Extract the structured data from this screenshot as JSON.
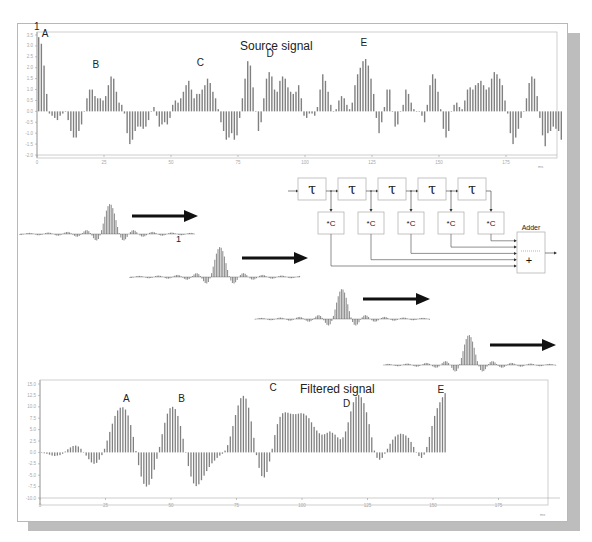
{
  "figure": {
    "title_source": "Source signal",
    "title_filtered": "Filtered signal",
    "marker_one_top": "1",
    "marker_one_mid": "1",
    "x_unit": "ms",
    "peak_labels_source": [
      "A",
      "B",
      "C",
      "D",
      "E"
    ],
    "peak_labels_filtered": [
      "A",
      "B",
      "C",
      "D",
      "E"
    ]
  },
  "diagram": {
    "delay_symbol": "τ",
    "delay_count": 5,
    "multiplier_label": "*C",
    "multiplier_count": 5,
    "adder_label": "Adder",
    "adder_symbol": "+"
  },
  "colors": {
    "bar": "#808080",
    "bar_dark": "#5a5a5a",
    "axis": "#9a9a9a",
    "tick_text": "#a8a8a8",
    "frame": "#b8b8b8",
    "shadow": "#bdbdbd",
    "arrow": "#111111",
    "text": "#222222"
  },
  "chart_data": [
    {
      "type": "bar",
      "title": "Source signal",
      "xlabel": "ms",
      "ylabel": "",
      "x_ticks": [
        0,
        25,
        50,
        75,
        100,
        125,
        150,
        175
      ],
      "y_ticks": [
        3.5,
        3.0,
        2.5,
        2.0,
        1.5,
        1.0,
        0.5,
        0.0,
        -0.5,
        -1.0,
        -1.5,
        -2.0
      ],
      "ylim": [
        -2.0,
        3.5
      ],
      "xlim": [
        0,
        194
      ],
      "grid": false,
      "annotations": [
        {
          "text": "A",
          "x": 3,
          "y": 3.4
        },
        {
          "text": "B",
          "x": 22,
          "y": 2.0
        },
        {
          "text": "C",
          "x": 61,
          "y": 2.1
        },
        {
          "text": "D",
          "x": 87,
          "y": 2.5
        },
        {
          "text": "E",
          "x": 122,
          "y": 3.0
        }
      ],
      "values": [
        3.4,
        3.1,
        2.1,
        0.8,
        -0.1,
        -0.2,
        -0.3,
        -0.4,
        -0.2,
        -0.1,
        0.0,
        -0.4,
        -0.9,
        -1.2,
        -1.2,
        -0.9,
        -0.6,
        0.0,
        0.6,
        1.0,
        1.0,
        0.7,
        0.6,
        0.6,
        0.5,
        0.7,
        1.2,
        1.6,
        1.5,
        0.9,
        0.4,
        0.3,
        -0.1,
        -1.0,
        -1.5,
        -1.3,
        -0.9,
        -0.7,
        -0.7,
        -0.8,
        -0.7,
        -0.4,
        0.0,
        0.2,
        -0.2,
        -0.7,
        -0.6,
        -0.5,
        -0.6,
        -0.3,
        0.3,
        0.5,
        0.4,
        0.6,
        0.9,
        1.2,
        1.4,
        1.0,
        0.6,
        0.8,
        0.8,
        1.0,
        1.2,
        1.5,
        1.3,
        0.9,
        0.6,
        0.1,
        -0.5,
        -0.9,
        -1.3,
        -1.2,
        -1.0,
        -1.3,
        -1.1,
        -0.3,
        0.6,
        1.5,
        2.3,
        2.1,
        1.1,
        0.0,
        -0.9,
        -0.5,
        0.6,
        1.5,
        1.8,
        1.6,
        1.0,
        0.9,
        1.4,
        1.6,
        1.5,
        1.1,
        0.9,
        0.8,
        0.9,
        1.2,
        0.6,
        -0.2,
        -0.3,
        -0.1,
        -0.1,
        -0.2,
        0.2,
        1.0,
        1.7,
        1.4,
        0.9,
        0.3,
        0.0,
        0.1,
        0.5,
        0.7,
        0.6,
        0.3,
        0.1,
        0.4,
        1.2,
        1.7,
        2.0,
        2.3,
        2.4,
        2.1,
        1.5,
        0.8,
        -0.3,
        -1.0,
        -0.5,
        0.2,
        1.0,
        1.0,
        0.0,
        -0.7,
        -0.6,
        0.0,
        0.3,
        1.0,
        0.8,
        0.4,
        0.1,
        0.0,
        0.0,
        -0.2,
        -0.5,
        0.3,
        1.2,
        1.7,
        1.5,
        0.9,
        0.1,
        -0.8,
        -1.2,
        -0.9,
        0.0,
        0.3,
        0.4,
        0.2,
        0.1,
        0.5,
        1.0,
        1.1,
        1.0,
        1.2,
        1.3,
        1.4,
        1.2,
        1.0,
        1.1,
        1.5,
        1.8,
        1.7,
        1.5,
        1.2,
        0.5,
        -0.1,
        -1.0,
        -1.5,
        -1.2,
        -0.8,
        -0.3,
        0.0,
        0.6,
        1.3,
        1.6,
        1.5,
        0.7,
        -0.3,
        -1.1,
        -1.6,
        -1.0,
        -0.9,
        -0.7,
        -0.8,
        -0.9,
        -1.3
      ]
    },
    {
      "type": "bar",
      "title": "Filtered signal",
      "xlabel": "ms",
      "ylabel": "",
      "x_ticks": [
        0,
        25,
        50,
        75,
        100,
        125,
        150,
        175
      ],
      "y_ticks": [
        15.0,
        12.5,
        10.0,
        7.5,
        5.0,
        2.5,
        0.0,
        -2.5,
        -5.0,
        -7.5,
        -10.0
      ],
      "ylim": [
        -10.0,
        15.0
      ],
      "xlim": [
        0,
        194
      ],
      "grid": false,
      "annotations": [
        {
          "text": "A",
          "x": 33,
          "y": 11.0
        },
        {
          "text": "B",
          "x": 54,
          "y": 11.0
        },
        {
          "text": "C",
          "x": 89,
          "y": 13.5
        },
        {
          "text": "D",
          "x": 117,
          "y": 10.0
        },
        {
          "text": "E",
          "x": 153,
          "y": 13.0
        }
      ],
      "values": [
        -0.1,
        -0.2,
        -0.3,
        -0.5,
        -0.7,
        -0.8,
        -0.7,
        -0.6,
        -0.3,
        0.2,
        0.7,
        1.1,
        1.4,
        1.5,
        1.3,
        0.8,
        0.1,
        -0.7,
        -1.5,
        -2.2,
        -2.5,
        -2.3,
        -1.6,
        -0.6,
        0.8,
        2.6,
        4.5,
        6.3,
        8.0,
        9.2,
        9.8,
        9.9,
        9.4,
        8.1,
        6.0,
        3.4,
        0.3,
        -2.8,
        -5.3,
        -6.9,
        -7.5,
        -7.1,
        -5.8,
        -3.8,
        -1.4,
        1.2,
        4.0,
        6.5,
        8.5,
        9.7,
        10.0,
        9.5,
        8.0,
        5.8,
        3.0,
        0.0,
        -3.0,
        -5.3,
        -6.8,
        -7.4,
        -7.0,
        -6.1,
        -5.1,
        -4.1,
        -3.2,
        -2.4,
        -1.8,
        -1.2,
        -0.7,
        -0.3,
        0.4,
        1.6,
        3.5,
        5.8,
        8.2,
        10.3,
        11.9,
        12.4,
        11.8,
        9.8,
        6.8,
        3.2,
        -0.6,
        -3.4,
        -5.2,
        -5.5,
        -4.3,
        -2.0,
        0.8,
        3.8,
        6.2,
        7.8,
        8.6,
        8.8,
        8.7,
        8.5,
        8.4,
        8.4,
        8.5,
        8.6,
        8.5,
        8.1,
        7.5,
        6.6,
        5.6,
        4.8,
        4.2,
        3.9,
        4.0,
        4.3,
        4.6,
        4.3,
        3.9,
        3.3,
        2.9,
        3.3,
        4.6,
        6.6,
        9.0,
        11.0,
        12.2,
        12.6,
        12.1,
        10.8,
        8.8,
        6.2,
        3.3,
        0.4,
        -1.2,
        -1.6,
        -1.2,
        -0.3,
        0.8,
        1.9,
        2.8,
        3.5,
        3.9,
        4.1,
        4.0,
        3.7,
        3.2,
        2.3,
        1.2,
        0.1,
        -0.8,
        -1.2,
        -0.5,
        1.2,
        3.4,
        5.8,
        8.0,
        9.7,
        11.0,
        12.1,
        13.0
      ]
    }
  ]
}
